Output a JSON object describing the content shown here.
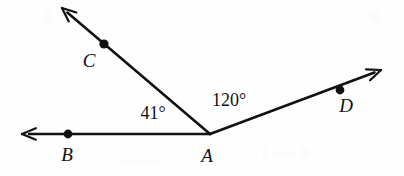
{
  "figure": {
    "kind": "geometry-angle-diagram",
    "width": 404,
    "height": 176,
    "background_color": "#fefefe",
    "stroke_color": "#111111",
    "stroke_width": 2.6,
    "vertex": {
      "name": "A",
      "x": 210,
      "y": 134
    },
    "rays": [
      {
        "id": "ray-ab",
        "from": "A",
        "through": "B",
        "tip_x": 22,
        "tip_y": 134,
        "arrow": true,
        "direction_degrees": 180
      },
      {
        "id": "ray-ac",
        "from": "A",
        "through": "C",
        "tip_x": 62,
        "tip_y": 8,
        "arrow": true,
        "direction_degrees": 139.6
      },
      {
        "id": "ray-ad",
        "from": "A",
        "through": "D",
        "tip_x": 381,
        "tip_y": 70,
        "arrow": true,
        "direction_degrees": 20.5
      }
    ],
    "points": [
      {
        "label": "B",
        "dot_x": 68,
        "dot_y": 134,
        "label_x": 67,
        "label_y": 154,
        "dot_radius": 4.4
      },
      {
        "label": "C",
        "dot_x": 104,
        "dot_y": 44,
        "label_x": 89,
        "label_y": 60,
        "dot_radius": 4.6
      },
      {
        "label": "D",
        "dot_x": 340,
        "dot_y": 90,
        "label_x": 346,
        "label_y": 105,
        "dot_radius": 4.4
      },
      {
        "label": "A",
        "dot_x": null,
        "dot_y": null,
        "label_x": 207,
        "label_y": 155,
        "dot_radius": 0
      }
    ],
    "angles": [
      {
        "id": "angle-bac",
        "value": "41°",
        "label_x": 153,
        "label_y": 113,
        "between": "ray-ab / ray-ac"
      },
      {
        "id": "angle-cad",
        "value": "120°",
        "label_x": 229,
        "label_y": 100,
        "between": "ray-ac / ray-ad"
      }
    ]
  },
  "chart_data": {
    "type": "diagram",
    "title": "",
    "labels": [
      "A",
      "B",
      "C",
      "D",
      "41°",
      "120°"
    ]
  }
}
